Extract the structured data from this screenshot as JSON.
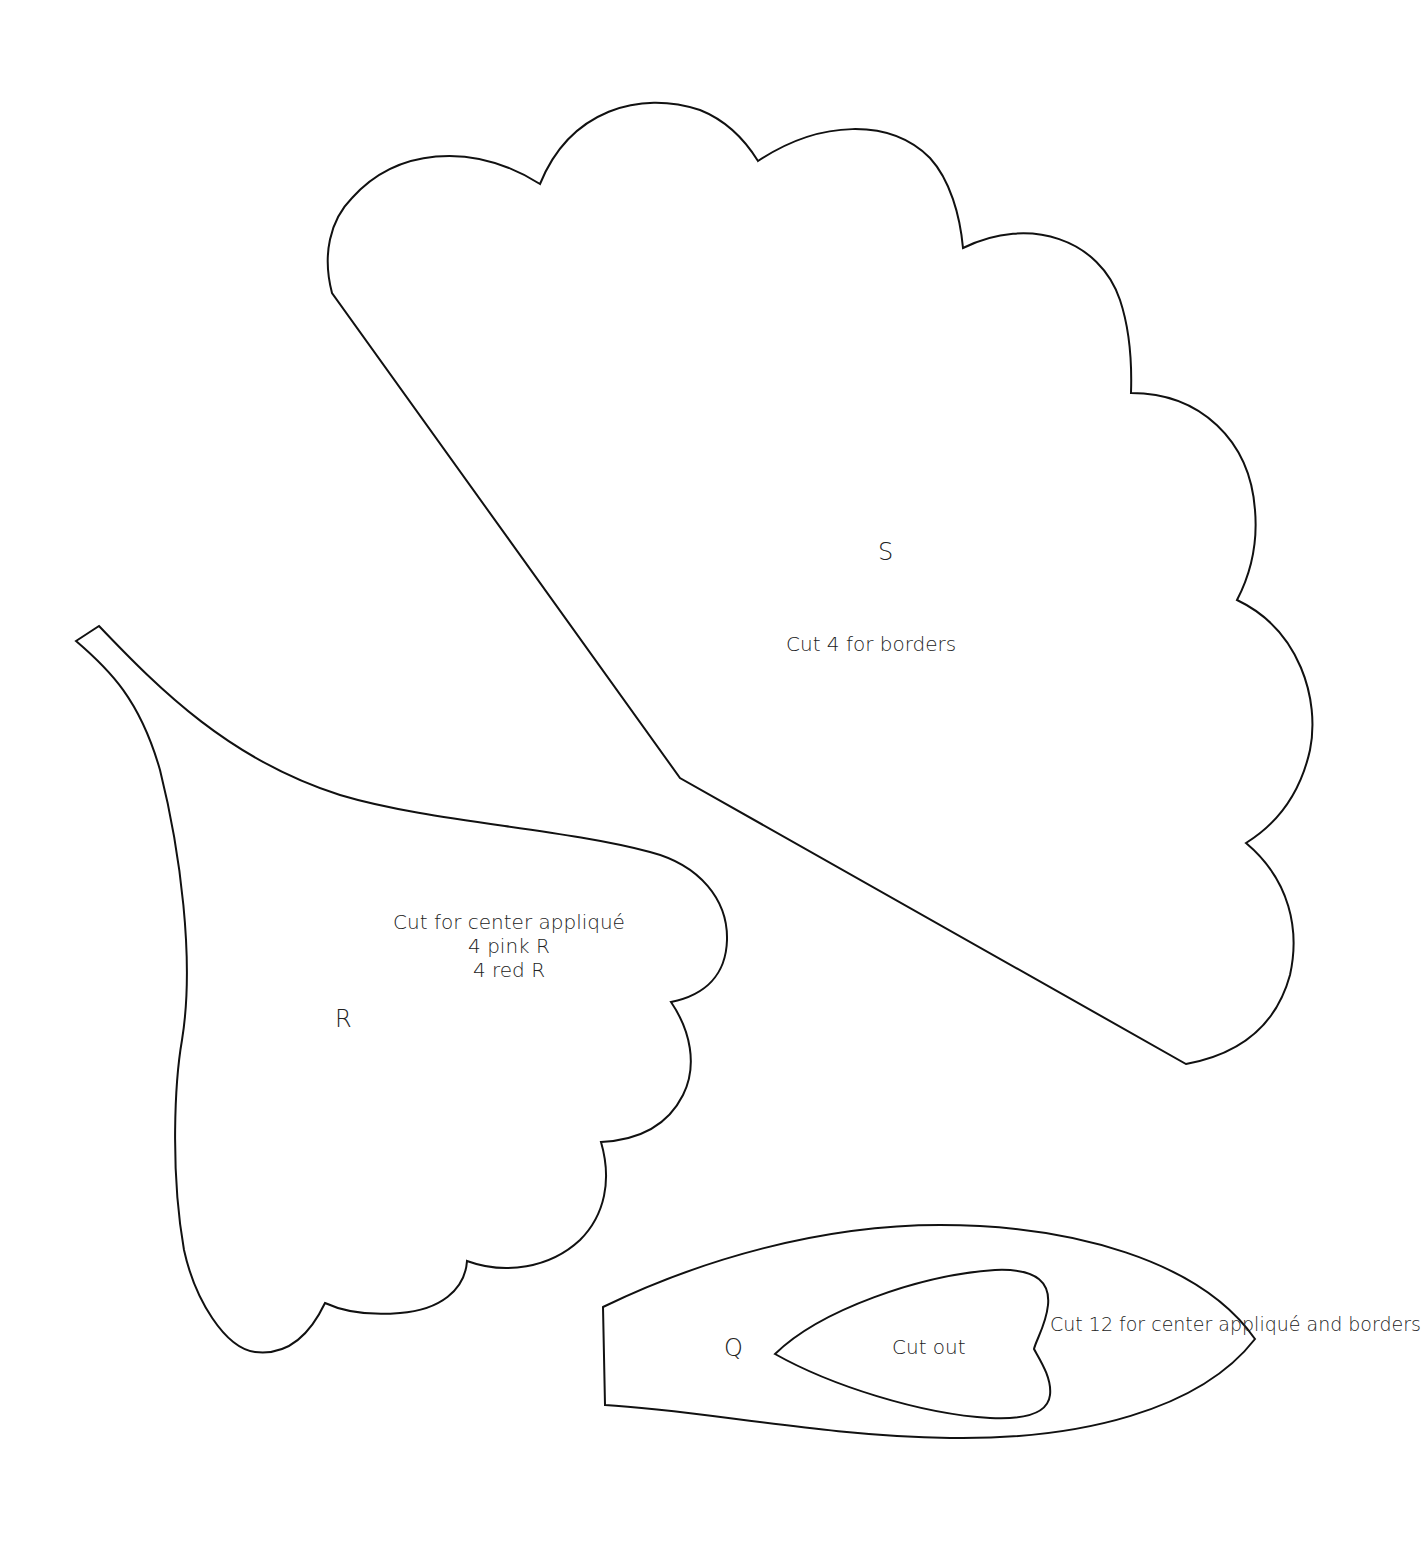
{
  "pattern": {
    "stroke_color": "#111111",
    "background_color": "#ffffff",
    "pieces": [
      {
        "id": "S",
        "letter": "S",
        "instructions": [
          "Cut 4 for borders"
        ]
      },
      {
        "id": "R",
        "letter": "R",
        "instructions": [
          "Cut for center appliqué",
          "4 pink R",
          "4 red R"
        ]
      },
      {
        "id": "Q",
        "letter": "Q",
        "inner_label": "Cut out",
        "instructions": [
          "Cut 12 for center",
          "appliqué and",
          "borders"
        ]
      }
    ]
  }
}
